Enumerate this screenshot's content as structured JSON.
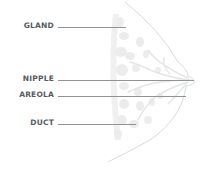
{
  "diagram": {
    "title": "",
    "labels": [
      {
        "id": "gland",
        "text": "GLAND"
      },
      {
        "id": "nipple",
        "text": "NIPPLE"
      },
      {
        "id": "areola",
        "text": "AREOLA"
      },
      {
        "id": "duct",
        "text": "DUCT"
      }
    ],
    "colors": {
      "label_text": "#555b60",
      "leader_line": "#8f9498",
      "outline": "#d4d6d8",
      "tissue": "#ececec",
      "background": "#ffffff"
    }
  }
}
